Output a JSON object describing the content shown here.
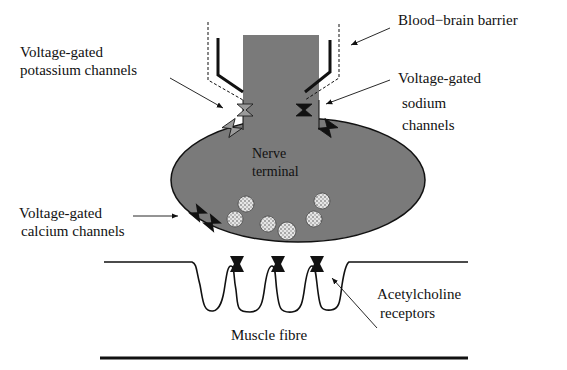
{
  "diagram": {
    "labels": {
      "blood_brain_barrier": "Blood−brain barrier",
      "potassium_line1": "Voltage-gated",
      "potassium_line2": "potassium channels",
      "sodium_line1": "Voltage-gated",
      "sodium_line2": "sodium",
      "sodium_line3": "channels",
      "nerve_line1": "Nerve",
      "nerve_line2": "terminal",
      "calcium_line1": "Voltage-gated",
      "calcium_line2": "calcium channels",
      "ach_line1": "Acetylcholine",
      "ach_line2": "receptors",
      "muscle": "Muscle fibre"
    },
    "colors": {
      "nerve_fill": "#7a7a7a",
      "potassium_channel": "#9a9a9a",
      "dark_channel": "#111111",
      "vesicle_fill": "#d8d8d8",
      "line": "#111111"
    },
    "vesicle_count": 7,
    "ach_receptor_count": 3
  }
}
